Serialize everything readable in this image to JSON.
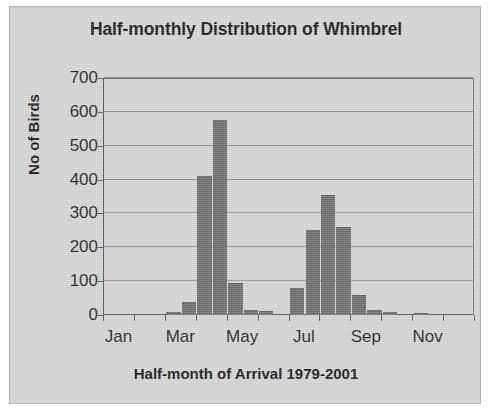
{
  "figure": {
    "background_color": "#d4d4d4",
    "bar_color": "#6b6b6b",
    "grid_color": "#8e8e8e",
    "axis_color": "#555555"
  },
  "chart_data": {
    "type": "bar",
    "title": "Half-monthly Distribution of Whimbrel",
    "xlabel": "Half-month of Arrival 1979-2001",
    "ylabel": "No of Birds",
    "ylim": [
      0,
      700
    ],
    "ytick_values": [
      0,
      100,
      200,
      300,
      400,
      500,
      600,
      700
    ],
    "ytick_labels": [
      "0",
      "100",
      "200",
      "300",
      "400",
      "500",
      "600",
      "700"
    ],
    "grid": true,
    "legend": "none",
    "xtick_labels": [
      "Jan",
      "Mar",
      "May",
      "Jul",
      "Sep",
      "Nov"
    ],
    "xtick_positions": [
      0,
      4,
      8,
      12,
      16,
      20
    ],
    "categories": [
      "Jan 1",
      "Jan 2",
      "Feb 1",
      "Feb 2",
      "Mar 1",
      "Mar 2",
      "Apr 1",
      "Apr 2",
      "May 1",
      "May 2",
      "Jun 1",
      "Jun 2",
      "Jul 1",
      "Jul 2",
      "Aug 1",
      "Aug 2",
      "Sep 1",
      "Sep 2",
      "Oct 1",
      "Oct 2",
      "Nov 1",
      "Nov 2",
      "Dec 1",
      "Dec 2"
    ],
    "values": [
      0,
      0,
      0,
      0,
      8,
      38,
      410,
      575,
      95,
      15,
      12,
      0,
      80,
      250,
      355,
      260,
      60,
      14,
      8,
      0,
      7,
      0,
      0,
      0
    ]
  }
}
